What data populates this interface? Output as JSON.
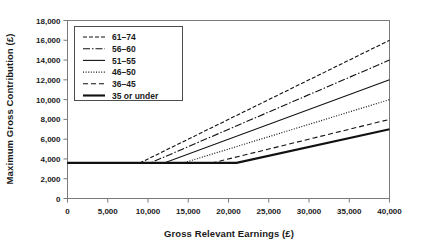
{
  "chart_data": {
    "type": "line",
    "title": "",
    "xlabel": "Gross Relevant Earnings (£)",
    "ylabel": "Maximum Gross Contribution (£)",
    "xlim": [
      0,
      40000
    ],
    "ylim": [
      0,
      18000
    ],
    "xticks": [
      0,
      5000,
      10000,
      15000,
      20000,
      25000,
      30000,
      35000,
      40000
    ],
    "xtick_labels": [
      "0",
      "5,000",
      "10,000",
      "15,000",
      "20,000",
      "25,000",
      "30,000",
      "35,000",
      "40,000"
    ],
    "yticks": [
      0,
      2000,
      4000,
      6000,
      8000,
      10000,
      12000,
      14000,
      16000,
      18000
    ],
    "ytick_labels": [
      "0",
      "2,000",
      "4,000",
      "6,000",
      "8,000",
      "10,000",
      "12,000",
      "14,000",
      "16,000",
      "18,000"
    ],
    "grid": false,
    "legend_position": "upper-left",
    "line_color": "#111111",
    "frame_color": "#7a7a7a",
    "series": [
      {
        "name": "61–74",
        "dash": "4,2",
        "width": 1.1,
        "points": [
          [
            0,
            3600
          ],
          [
            9000,
            3600
          ],
          [
            40000,
            16000
          ]
        ]
      },
      {
        "name": "56–60",
        "dash": "7,2,1.5,2",
        "width": 1.1,
        "points": [
          [
            0,
            3600
          ],
          [
            10300,
            3600
          ],
          [
            40000,
            14000
          ]
        ]
      },
      {
        "name": "51–55",
        "dash": "none",
        "width": 1.1,
        "points": [
          [
            0,
            3600
          ],
          [
            12000,
            3600
          ],
          [
            40000,
            12000
          ]
        ]
      },
      {
        "name": "46–50",
        "dash": "1,1.6",
        "width": 1.2,
        "points": [
          [
            0,
            3600
          ],
          [
            14400,
            3600
          ],
          [
            40000,
            10000
          ]
        ]
      },
      {
        "name": "36–45",
        "dash": "5,3",
        "width": 1.1,
        "points": [
          [
            0,
            3600
          ],
          [
            18000,
            3600
          ],
          [
            40000,
            8000
          ]
        ]
      },
      {
        "name": "35 or under",
        "dash": "none",
        "width": 2.1,
        "points": [
          [
            0,
            3600
          ],
          [
            21000,
            3600
          ],
          [
            40000,
            7000
          ]
        ]
      }
    ]
  },
  "legend": {
    "items": [
      {
        "label": "61–74"
      },
      {
        "label": "56–60"
      },
      {
        "label": "51–55"
      },
      {
        "label": "46–50"
      },
      {
        "label": "36–45"
      },
      {
        "label": "35 or under"
      }
    ]
  }
}
